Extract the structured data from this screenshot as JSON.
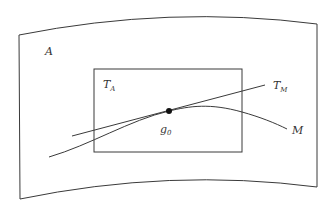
{
  "diagram": {
    "type": "tangent-space-illustration",
    "outer_region": {
      "label": "A",
      "shape": "curved-quadrilateral"
    },
    "inner_rectangle": {
      "label_main": "T",
      "label_sub": "A"
    },
    "tangent_line": {
      "label_main": "T",
      "label_sub": "M"
    },
    "curve": {
      "label": "M"
    },
    "point": {
      "label_main": "g",
      "label_sub": "0"
    },
    "colors": {
      "stroke": "#3a3a3a",
      "text": "#333333",
      "point": "#111111",
      "background": "#ffffff"
    }
  }
}
